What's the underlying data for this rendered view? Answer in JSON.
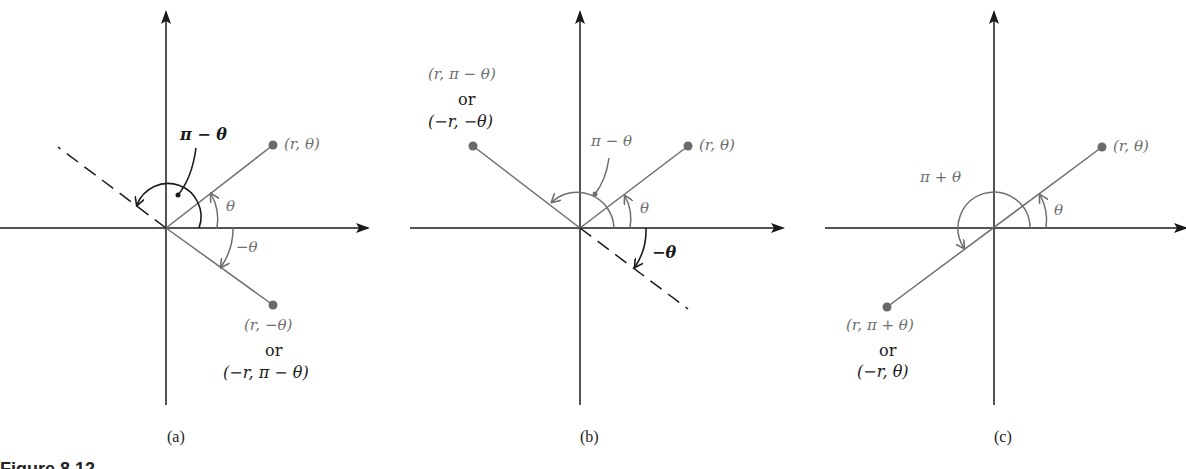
{
  "figure": {
    "caption": "Figure 8.12",
    "colors": {
      "axis": "#1a1a1a",
      "ray": "#6e6e6e",
      "point": "#6a6a6a",
      "background": "#ffffff"
    },
    "panels": [
      {
        "id": "a",
        "label": "(a)",
        "point_top": "(r, θ)",
        "angle_theta": "θ",
        "angle_neg_theta": "−θ",
        "angle_pi_minus_theta": "π − θ",
        "point_bottom_line1": "(r, −θ)",
        "point_bottom_or": "or",
        "point_bottom_line2": "(−r, π − θ)"
      },
      {
        "id": "b",
        "label": "(b)",
        "point_top_right": "(r, θ)",
        "point_top_left_line1": "(r, π − θ)",
        "point_top_left_or": "or",
        "point_top_left_line2": "(−r, −θ)",
        "angle_theta": "θ",
        "angle_pi_minus_theta": "π − θ",
        "angle_neg_theta": "−θ"
      },
      {
        "id": "c",
        "label": "(c)",
        "point_top_right": "(r, θ)",
        "angle_theta": "θ",
        "angle_pi_plus_theta": "π + θ",
        "point_bottom_left_line1": "(r, π + θ)",
        "point_bottom_left_or": "or",
        "point_bottom_left_line2": "(−r, θ)"
      }
    ]
  }
}
